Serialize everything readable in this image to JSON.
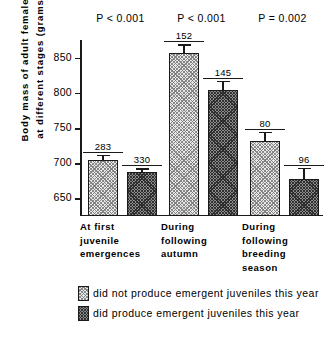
{
  "chart_data": {
    "type": "bar",
    "title": "",
    "xlabel": "",
    "ylabel_lines": [
      "Body  mass  of  adult  females",
      "at  different  stages  (grams)"
    ],
    "ylim": [
      625,
      875
    ],
    "yticks": [
      650,
      700,
      750,
      800,
      850
    ],
    "ytick_labels": [
      "650",
      "700",
      "750",
      "800",
      "850"
    ],
    "grid": false,
    "legend_position": "bottom",
    "categories": [
      [
        "At   first",
        "juvenile",
        "emergences"
      ],
      [
        "During",
        "following",
        "autumn"
      ],
      [
        "During",
        "following",
        "breeding",
        "season"
      ]
    ],
    "series": [
      {
        "name": "did not produce emergent juveniles this year",
        "fill": "light",
        "values": [
          705,
          856,
          732
        ],
        "errors": [
          5,
          9,
          9
        ],
        "n": [
          283,
          152,
          80
        ]
      },
      {
        "name": "did produce emergent juveniles this year",
        "fill": "dark",
        "values": [
          687,
          804,
          678
        ],
        "errors": [
          4,
          9,
          11
        ],
        "n": [
          330,
          145,
          96
        ]
      }
    ],
    "annotations": [
      "P < 0.001",
      "P < 0.001",
      "P = 0.002"
    ]
  },
  "legend": {
    "items": [
      {
        "label": "did not produce emergent juveniles this year"
      },
      {
        "label": "did produce emergent juveniles this year"
      }
    ]
  },
  "colors": {
    "axis": "#1a1a1a",
    "light_fill": "#e8e8e8",
    "dark_fill": "#8c8c8c",
    "background": "#ffffff"
  }
}
